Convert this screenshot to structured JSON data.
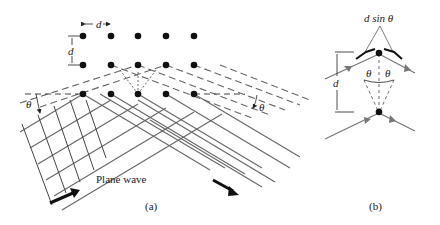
{
  "figure": {
    "panel_a": {
      "caption": "(a)",
      "spacing_label": "d",
      "vertical_spacing_label": "d",
      "angle_label_left": "θ",
      "angle_label_right": "θ",
      "wave_label": "Plane wave",
      "lattice": {
        "columns_x": [
          83,
          111,
          138,
          166,
          194
        ],
        "rows_y": [
          36,
          65,
          94
        ]
      }
    },
    "panel_b": {
      "caption": "(b)",
      "path_difference_label": "d sin θ",
      "spacing_label": "d",
      "angle_label_left": "θ",
      "angle_label_right": "θ"
    },
    "colors": {
      "ink": "#222222",
      "ray": "#666666",
      "dot": "#111111"
    }
  }
}
